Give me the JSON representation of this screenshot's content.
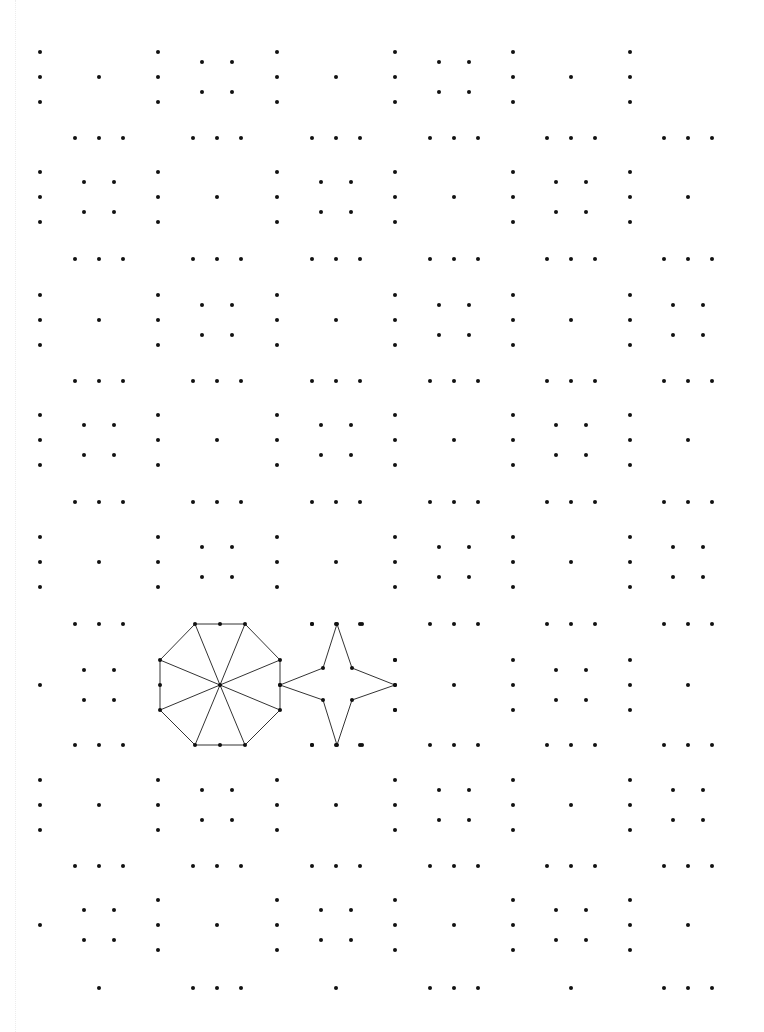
{
  "worksheet": {
    "title": "",
    "dot_color": "#111111",
    "line_color": "#333333",
    "background": "#ffffff",
    "dot_radius": 2,
    "grid": {
      "column_x": [
        40,
        158,
        277,
        395,
        513,
        630
      ],
      "cell_center_x": [
        99,
        217,
        336,
        454,
        571,
        688
      ],
      "row_mid_y": [
        77,
        197,
        320,
        440,
        562,
        685,
        805,
        925
      ],
      "horizontal_row_y": [
        138,
        259,
        381,
        502,
        624,
        745,
        866,
        988
      ],
      "vertical_spacing": 25,
      "horizontal_spacing": 24,
      "square_half": 15
    },
    "cell_rows": [
      [
        "1",
        "4",
        "1",
        "4",
        "1",
        "0"
      ],
      [
        "4",
        "1",
        "4",
        "1",
        "4",
        "1"
      ],
      [
        "1",
        "4",
        "1",
        "4",
        "1",
        "4"
      ],
      [
        "4",
        "1",
        "4",
        "1",
        "4",
        "1"
      ],
      [
        "1",
        "4",
        "1",
        "4",
        "1",
        "4"
      ],
      [
        "4",
        "octagon",
        "star",
        "1",
        "4",
        "1"
      ],
      [
        "1",
        "4",
        "1",
        "4",
        "1",
        "4"
      ],
      [
        "4",
        "1",
        "4",
        "1",
        "4",
        "1"
      ]
    ],
    "column_rows": [
      [
        "3",
        "3",
        "3",
        "3",
        "3",
        "3"
      ],
      [
        "3",
        "3",
        "3",
        "3",
        "3",
        "3"
      ],
      [
        "3",
        "3",
        "3",
        "3",
        "3",
        "3"
      ],
      [
        "3",
        "3",
        "3",
        "3",
        "3",
        "3"
      ],
      [
        "3",
        "3",
        "3",
        "3",
        "3",
        "3"
      ],
      [
        "1",
        "shape",
        "shape",
        "3",
        "3",
        "3"
      ],
      [
        "3",
        "3",
        "3",
        "3",
        "3",
        "3"
      ],
      [
        "1",
        "3",
        "3",
        "3",
        "3",
        "3"
      ]
    ],
    "horizontal_rows": [
      [
        "3",
        "3",
        "3",
        "3",
        "3",
        "3"
      ],
      [
        "3",
        "3",
        "3",
        "3",
        "3",
        "3"
      ],
      [
        "3",
        "3",
        "3",
        "3",
        "3",
        "3"
      ],
      [
        "3",
        "3",
        "3",
        "3",
        "3",
        "3"
      ],
      [
        "3",
        "shape",
        "3",
        "3",
        "3",
        "3"
      ],
      [
        "3",
        "shape",
        "3",
        "3",
        "3",
        "3"
      ],
      [
        "3",
        "3",
        "3",
        "3",
        "3",
        "3"
      ],
      [
        "1",
        "3",
        "1",
        "3",
        "1",
        "3"
      ]
    ],
    "shapes": [
      {
        "name": "octagon-with-spokes",
        "vertices": [
          [
            195,
            624
          ],
          [
            245,
            624
          ],
          [
            280,
            660
          ],
          [
            280,
            710
          ],
          [
            245,
            745
          ],
          [
            195,
            745
          ],
          [
            160,
            710
          ],
          [
            160,
            660
          ]
        ],
        "center": [
          220,
          685
        ],
        "extra_dots": [
          [
            220,
            624
          ],
          [
            220,
            745
          ],
          [
            160,
            685
          ],
          [
            280,
            685
          ]
        ]
      },
      {
        "name": "four-point-star",
        "vertices": [
          [
            337,
            624
          ],
          [
            352,
            668
          ],
          [
            395,
            685
          ],
          [
            352,
            700
          ],
          [
            337,
            745
          ],
          [
            323,
            700
          ],
          [
            280,
            685
          ],
          [
            323,
            668
          ]
        ],
        "extra_dots": [
          [
            312,
            624
          ],
          [
            362,
            624
          ],
          [
            312,
            745
          ],
          [
            362,
            745
          ],
          [
            395,
            660
          ],
          [
            395,
            710
          ]
        ]
      }
    ]
  }
}
